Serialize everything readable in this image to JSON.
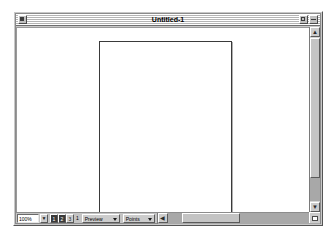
{
  "window": {
    "title": "Untitled-1",
    "close_box": "close-box",
    "zoom_box": "zoom-box",
    "collapse_box": "collapse-box",
    "frame_color": "#c8c8c8",
    "titlebar_stripe_light": "#ffffff",
    "titlebar_stripe_dark": "#b4b4b4"
  },
  "canvas": {
    "background_color": "#ffffff",
    "page": {
      "name": "document-page",
      "border_color": "#3a3a3a",
      "fill_color": "#ffffff",
      "orientation": "portrait"
    }
  },
  "statusbar": {
    "zoom_value": "100%",
    "zoom_placeholder": "100%",
    "zoom_stepper_up": "▲",
    "zoom_stepper_down": "▼",
    "page_nav": [
      {
        "label": "1",
        "active": true
      },
      {
        "label": "2",
        "active": true
      },
      {
        "label": "3",
        "active": false
      }
    ],
    "page_indicator": "1",
    "preview_popup": {
      "value": "Preview",
      "options": [
        "Preview",
        "Artwork",
        "Keyline"
      ]
    },
    "units_popup": {
      "value": "Points",
      "options": [
        "Points",
        "Picas",
        "Inches",
        "Millimeters",
        "Centimeters"
      ]
    },
    "hscroll_left_arrow": "◀",
    "hscroll_right_arrow": "▶"
  },
  "scrollbars": {
    "vertical": {
      "up_arrow": "▲",
      "down_arrow": "▼",
      "thumb_name": "vertical-scroll-thumb"
    },
    "horizontal": {
      "thumb_name": "horizontal-scroll-thumb"
    }
  },
  "resize": {
    "name": "resize-grow-box"
  }
}
